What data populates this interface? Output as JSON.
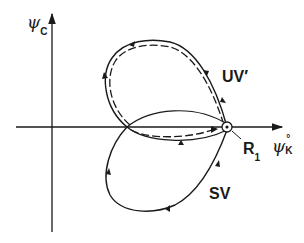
{
  "diagram": {
    "axes": {
      "y_axis_label": {
        "symbol": "ψ",
        "subscript": "C"
      },
      "x_axis_label": {
        "symbol": "ψ",
        "subscript": "K",
        "superscript": "°"
      }
    },
    "curves": [
      {
        "name": "UV'",
        "label": "UV′",
        "style": "solid + dashed double loop (upper)"
      },
      {
        "name": "SV",
        "label": "SV",
        "style": "solid loop (lower)"
      }
    ],
    "points": [
      {
        "name": "R1",
        "label": "R",
        "subscript": "1",
        "marker": "circle-dot"
      }
    ],
    "colors": {
      "ink": "#1a1a1a",
      "background": "#ffffff"
    }
  }
}
